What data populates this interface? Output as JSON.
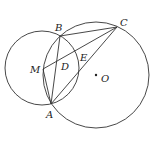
{
  "diagram": {
    "type": "geometry",
    "circles": [
      {
        "name": "circle-left",
        "cx": 42,
        "cy": 68,
        "r": 37
      },
      {
        "name": "circle-O",
        "cx": 96,
        "cy": 75,
        "r": 53
      }
    ],
    "points": {
      "A": {
        "x": 51,
        "y": 104,
        "label": "A",
        "lx": 46,
        "ly": 118
      },
      "B": {
        "x": 60,
        "y": 36,
        "label": "B",
        "lx": 55,
        "ly": 31
      },
      "C": {
        "x": 117,
        "y": 27,
        "label": "C",
        "lx": 120,
        "ly": 26
      },
      "M": {
        "x": 43,
        "y": 69,
        "label": "M",
        "lx": 31,
        "ly": 73
      },
      "D": {
        "label": "D",
        "lx": 61,
        "ly": 70
      },
      "E": {
        "label": "E",
        "lx": 80,
        "ly": 61
      },
      "O": {
        "x": 96,
        "y": 75,
        "label": "O",
        "lx": 101,
        "ly": 82
      }
    },
    "segments": [
      [
        "B",
        "C"
      ],
      [
        "B",
        "A"
      ],
      [
        "M",
        "C"
      ],
      [
        "A",
        "C"
      ],
      [
        "M",
        "A"
      ]
    ]
  }
}
